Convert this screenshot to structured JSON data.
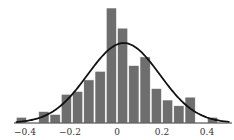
{
  "chart_data": {
    "type": "bar",
    "subtype": "histogram_with_normal_fit",
    "title": "",
    "xlabel": "",
    "ylabel": "",
    "xlim": [
      -0.47,
      0.5
    ],
    "grid": false,
    "legend": null,
    "bin_width": 0.05,
    "bins": [
      {
        "start": -0.45,
        "end": -0.4,
        "count": 1
      },
      {
        "start": -0.4,
        "end": -0.35,
        "count": 0
      },
      {
        "start": -0.35,
        "end": -0.3,
        "count": 2
      },
      {
        "start": -0.3,
        "end": -0.25,
        "count": 1.5
      },
      {
        "start": -0.25,
        "end": -0.2,
        "count": 5
      },
      {
        "start": -0.2,
        "end": -0.15,
        "count": 5.5
      },
      {
        "start": -0.15,
        "end": -0.1,
        "count": 7.5
      },
      {
        "start": -0.1,
        "end": -0.05,
        "count": 9
      },
      {
        "start": -0.05,
        "end": 0.0,
        "count": 20
      },
      {
        "start": 0.0,
        "end": 0.05,
        "count": 16.5
      },
      {
        "start": 0.05,
        "end": 0.1,
        "count": 10
      },
      {
        "start": 0.1,
        "end": 0.15,
        "count": 11.5
      },
      {
        "start": 0.15,
        "end": 0.2,
        "count": 6
      },
      {
        "start": 0.2,
        "end": 0.25,
        "count": 4
      },
      {
        "start": 0.25,
        "end": 0.3,
        "count": 3
      },
      {
        "start": 0.3,
        "end": 0.35,
        "count": 4.5
      },
      {
        "start": 0.35,
        "end": 0.4,
        "count": 0
      },
      {
        "start": 0.4,
        "end": 0.45,
        "count": 1
      }
    ],
    "normal_fit": {
      "mean": 0.03,
      "sd": 0.16,
      "peak_count": 13.9
    },
    "xticks": [
      -0.4,
      -0.2,
      0,
      0.2,
      0.4
    ],
    "xtick_labels": [
      "−0.4",
      "−0.2",
      "0",
      "0.2",
      "0.4"
    ],
    "colors": {
      "bar": "#6e6e6e",
      "bar_edge": "#ffffff",
      "curve": "#111111",
      "axis": "#333333"
    }
  }
}
